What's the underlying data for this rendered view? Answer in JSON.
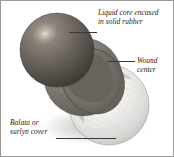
{
  "figure": {
    "name": "golf-ball-cutaway-diagram",
    "background_color": "#ffffff",
    "border_color": "#9a9a9a"
  },
  "labels": {
    "core": {
      "text": "Liquid core encased\nin solid rubber",
      "line1": "Liquid core encased",
      "line2": "in solid rubber"
    },
    "wound": {
      "text": "Wound\ncenter",
      "line1": "Wound",
      "line2": "center"
    },
    "cover": {
      "text": "Balata or\nsurlyn cover",
      "line1": "Balata or",
      "line2": "surlyn cover"
    }
  },
  "parts": {
    "core": {
      "name": "liquid-core",
      "color": "#6d6761",
      "highlight": "#b4aca3"
    },
    "wound_center": {
      "name": "wound-center",
      "color": "#8c8880",
      "shadow": "#4e4a45"
    },
    "cover": {
      "name": "balata-surlyn-cover",
      "color": "#f4f4f2",
      "shade": "#c9c9c6"
    }
  },
  "leaders": {
    "core_leader": "leader-line",
    "wound_leader": "leader-line",
    "cover_leader": "leader-line"
  }
}
